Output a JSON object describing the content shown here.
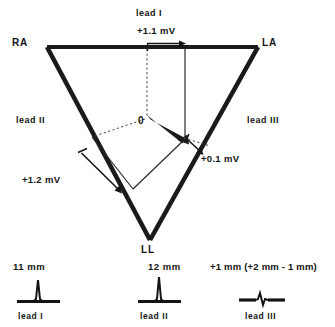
{
  "figure": {
    "title_vectors": {
      "lead_1_top_label": "lead I",
      "lead_1_projection": "+1.1 mV",
      "lead_2_projection": "+1.2 mV",
      "lead_3_projection": "+0.1 mV"
    },
    "vertices": {
      "right_arm": "RA",
      "left_arm": "LA",
      "left_leg": "LL"
    },
    "sides": {
      "lead_2_label": "lead II",
      "lead_3_label": "lead III"
    },
    "origin_label": "0",
    "traces": [
      {
        "amplitude": "11 mm",
        "name": "lead I",
        "kind": "tall-positive-spike"
      },
      {
        "amplitude": "12 mm",
        "name": "lead II",
        "kind": "tall-positive-spike"
      },
      {
        "amplitude": "+1 mm (+2 mm - 1 mm)",
        "name": "lead III",
        "kind": "small-biphasic-wiggle"
      }
    ],
    "colors": {
      "ink": "#141414",
      "background": "#ffffff",
      "thick_stroke": "#1a1a1a",
      "thin_stroke": "#2a2a2a"
    }
  }
}
